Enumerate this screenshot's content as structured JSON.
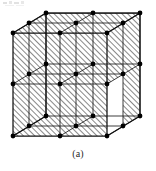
{
  "figure": {
    "caption": "(a)",
    "alt_description": "Cube divided into 2 x 2 x 2 sub-cells with nodes at every grid intersection, faces filled with diagonal hatching",
    "projection": "oblique",
    "colors": {
      "line": "#1a1a1a",
      "node": "#000000",
      "hatch": "#555555",
      "face": "#ffffff",
      "background": "#ffffff",
      "caption": "#2a2a2a"
    },
    "geometry": {
      "divisions": 2,
      "nodes_per_edge": 3,
      "total_nodes": 27,
      "front_top_left": [
        13,
        33
      ],
      "front_top_right": [
        107,
        33
      ],
      "front_bottom_left": [
        13,
        136
      ],
      "front_bottom_right": [
        107,
        136
      ],
      "depth_offset": [
        33,
        -20
      ],
      "cube_width": 94,
      "cube_height": 103,
      "hatch_angle_deg": 45,
      "hatch_spacing": 4,
      "node_radius": 2.3
    },
    "noise_bar": {
      "label": "scan-artifact",
      "visible": true
    }
  }
}
